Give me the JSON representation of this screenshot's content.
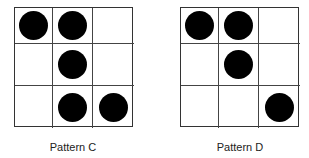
{
  "patterns": [
    {
      "label": "Pattern C",
      "grid": [
        [
          1,
          1,
          0
        ],
        [
          0,
          1,
          0
        ],
        [
          0,
          1,
          1
        ]
      ]
    },
    {
      "label": "Pattern D",
      "grid": [
        [
          1,
          1,
          0
        ],
        [
          0,
          1,
          0
        ],
        [
          0,
          0,
          1
        ]
      ]
    }
  ],
  "colors": {
    "dot": "#000000",
    "grid_line": "#444444",
    "background": "#ffffff"
  }
}
